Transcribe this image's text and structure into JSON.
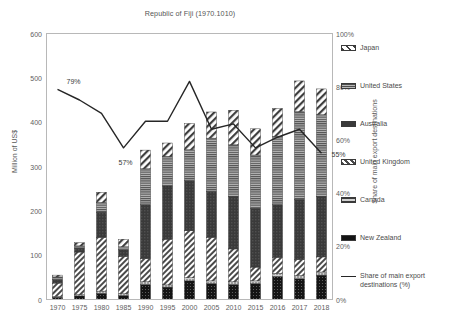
{
  "chart_data": {
    "type": "bar",
    "title": "Republic of Fiji (1970.1010)",
    "xlabel": "",
    "ylabel": "Million of US$",
    "y2label": "Share of main export destinations",
    "ylim": [
      0,
      600
    ],
    "y2lim": [
      0,
      100
    ],
    "yticks": [
      "0",
      "100",
      "200",
      "300",
      "400",
      "500",
      "600"
    ],
    "y2ticks": [
      "0%",
      "20%",
      "40%",
      "60%",
      "80%",
      "100%"
    ],
    "grid": false,
    "legend_position": "right",
    "categories": [
      "1970",
      "1975",
      "1980",
      "1985",
      "1990",
      "1995",
      "2000",
      "2005",
      "2010",
      "2015",
      "2016",
      "2017",
      "2018"
    ],
    "series": [
      {
        "name": "New Zealand",
        "pattern": "solid-dark",
        "color": "#1a1a1a",
        "values": [
          5,
          8,
          14,
          9,
          34,
          28,
          42,
          36,
          34,
          36,
          52,
          47,
          55
        ]
      },
      {
        "name": "Canada",
        "pattern": "fine-dots",
        "color": "#8a8a8a",
        "values": [
          2,
          3,
          5,
          4,
          6,
          5,
          7,
          6,
          6,
          6,
          7,
          7,
          7
        ]
      },
      {
        "name": "United Kingdom",
        "pattern": "diagonal-hatch",
        "color": "#d9d9d9",
        "values": [
          30,
          96,
          121,
          84,
          52,
          103,
          106,
          98,
          74,
          31,
          36,
          36,
          34
        ]
      },
      {
        "name": "Australia",
        "pattern": "solid-charcoal",
        "color": "#3d3d3d",
        "values": [
          8,
          9,
          57,
          15,
          122,
          120,
          113,
          104,
          119,
          133,
          119,
          136,
          137
        ]
      },
      {
        "name": "United States",
        "pattern": "horizontal-lines",
        "color": "#6e6e6e",
        "values": [
          6,
          5,
          22,
          7,
          81,
          67,
          70,
          120,
          116,
          120,
          154,
          198,
          184
        ]
      },
      {
        "name": "Japan",
        "pattern": "coarse-hatch",
        "color": "#e6e6e6",
        "values": [
          4,
          7,
          23,
          17,
          42,
          30,
          59,
          59,
          78,
          59,
          63,
          69,
          58
        ]
      }
    ],
    "line_series": {
      "name": "Share of main export destinations (%)",
      "color": "#262626",
      "values": [
        79,
        75,
        70,
        57,
        67,
        67,
        82,
        64,
        66,
        57,
        61,
        64,
        55
      ],
      "labels": [
        {
          "category": "1970",
          "text": "79%"
        },
        {
          "category": "1985",
          "text": "57%"
        },
        {
          "category": "2018",
          "text": "55%"
        }
      ]
    }
  },
  "legend": {
    "entries": [
      {
        "label": "Japan",
        "key": "japan"
      },
      {
        "label": "United States",
        "key": "united-states"
      },
      {
        "label": "Australia",
        "key": "australia"
      },
      {
        "label": "United Kingdom",
        "key": "united-kingdom"
      },
      {
        "label": "Canada",
        "key": "canada"
      },
      {
        "label": "New Zealand",
        "key": "new-zealand"
      },
      {
        "label": "Share of main export destinations (%)",
        "key": "share-line"
      }
    ]
  }
}
